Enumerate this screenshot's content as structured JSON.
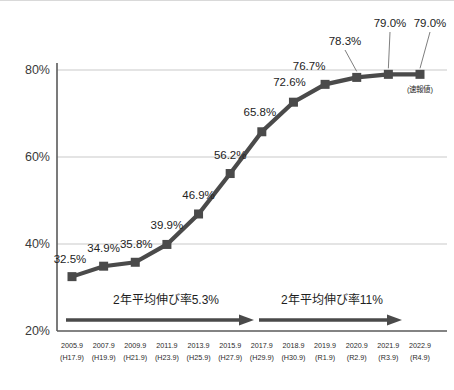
{
  "chart_data": {
    "type": "line",
    "title": "",
    "subtitle": "",
    "xlabel": "",
    "ylabel": "",
    "ylim": [
      20,
      80
    ],
    "y_ticks": [
      "20%",
      "40%",
      "60%",
      "80%"
    ],
    "y_tick_values": [
      20,
      40,
      60,
      80
    ],
    "grid": "horizontal",
    "legend_position": "none",
    "categories": [
      "2005.9",
      "2007.9",
      "2009.9",
      "2011.9",
      "2013.9",
      "2015.9",
      "2017.9",
      "2018.9",
      "2019.9",
      "2020.9",
      "2021.9",
      "2022.9"
    ],
    "categories_sub": [
      "(H17.9)",
      "(H19.9)",
      "(H21.9)",
      "(H23.9)",
      "(H25.9)",
      "(H27.9)",
      "(H29.9)",
      "(H30.9)",
      "(R1.9)",
      "(R2.9)",
      "(R3.9)",
      "(R4.9)"
    ],
    "values": [
      32.5,
      34.9,
      35.8,
      39.9,
      46.9,
      56.2,
      65.8,
      72.6,
      76.7,
      78.3,
      79.0,
      79.0
    ],
    "data_labels": [
      "32.5%",
      "34.9%",
      "35.8%",
      "39.9%",
      "46.9%",
      "56.2%",
      "65.8%",
      "72.6%",
      "76.7%",
      "78.3%",
      "79.0%",
      "79.0%"
    ],
    "series": [
      {
        "name": "",
        "values": [
          32.5,
          34.9,
          35.8,
          39.9,
          46.9,
          56.2,
          65.8,
          72.6,
          76.7,
          78.3,
          79.0,
          79.0
        ]
      }
    ],
    "annotations": [
      {
        "text": "2年平均伸び率5.3%",
        "from_category": "2005.9",
        "to_category": "2015.9"
      },
      {
        "text": "2年平均伸び率11%",
        "from_category": "2015.9",
        "to_category": "2022.9"
      },
      {
        "text": "(速報値)",
        "at_category": "2022.9"
      }
    ],
    "colors": {
      "series": "#4a4a4a",
      "marker": "#4a4a4a",
      "gridline": "#c9c9c9",
      "axis": "#5a5a5a",
      "annotation_arrow": "#4a4a4a",
      "text": "#232323",
      "background": "#ffffff"
    }
  },
  "axis": {
    "y_labels": [
      "80%",
      "60%",
      "40%",
      "20%"
    ]
  },
  "annotations": {
    "left_arrow_label": "2年平均伸び率5.3%",
    "right_arrow_label": "2年平均伸び率11%",
    "preliminary_note": "(速報値)"
  }
}
